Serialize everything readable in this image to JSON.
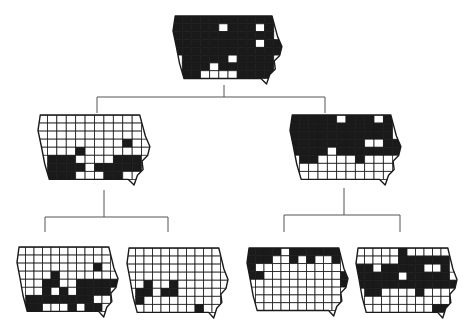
{
  "figure": {
    "colors": {
      "filled": "#1a1a1a",
      "empty": "#ffffff",
      "connector": "#555555"
    },
    "grid": {
      "cols": 12,
      "rows": 8
    },
    "nodes": [
      {
        "id": "root",
        "level": 0,
        "label": "",
        "pattern": [
          "111111111111",
          "111110111011",
          "111111111111",
          "111111111011",
          "111111111111",
          "111111011111",
          "111101111110",
          "111000011111"
        ]
      },
      {
        "id": "left",
        "level": 1,
        "parent": "root",
        "label": "",
        "pattern": [
          "000000000000",
          "000000000000",
          "000000000000",
          "000000000100",
          "000010000000",
          "111100001111",
          "111110111111",
          "111100011001"
        ]
      },
      {
        "id": "right",
        "level": 1,
        "parent": "root",
        "label": "",
        "pattern": [
          "111110111011",
          "111111111111",
          "111111111111",
          "111111110011",
          "111101111111",
          "111000010001",
          "000000000000",
          "000000000000"
        ]
      },
      {
        "id": "left-left",
        "level": 2,
        "parent": "left",
        "label": "",
        "pattern": [
          "000000000000",
          "000000000000",
          "000000000100",
          "000010000000",
          "000110011111",
          "000101011111",
          "011111111001",
          "011000101101"
        ]
      },
      {
        "id": "left-right",
        "level": 2,
        "parent": "left",
        "label": "",
        "pattern": [
          "000000000000",
          "000000000000",
          "000000000000",
          "000000000000",
          "001001000000",
          "111011000000",
          "110000000000",
          "100000001000"
        ]
      },
      {
        "id": "right-left",
        "level": 2,
        "parent": "right",
        "label": "",
        "pattern": [
          "111101111111",
          "111001010011",
          "100000000000",
          "110000000001",
          "000000000001",
          "000000000000",
          "000000000000",
          "000000000000"
        ]
      },
      {
        "id": "right-right",
        "level": 2,
        "parent": "right",
        "label": "",
        "pattern": [
          "000001000000",
          "000001111111",
          "110111110011",
          "111110111110",
          "111111111111",
          "111000010000",
          "000000000000",
          "000000000110"
        ]
      }
    ]
  }
}
